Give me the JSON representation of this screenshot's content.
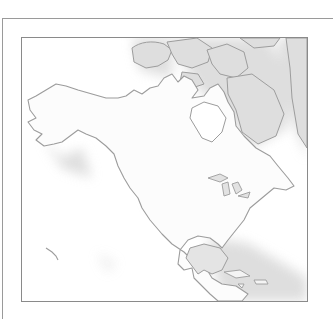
{
  "map": {
    "title": "",
    "region": "North America",
    "style": "grayscale outline",
    "colors": {
      "background": "#ffffff",
      "land": "#fbfbfb",
      "coast": "#9c9c9c",
      "shade": "#d6d6d6",
      "frame": "#8a8a8a"
    }
  }
}
